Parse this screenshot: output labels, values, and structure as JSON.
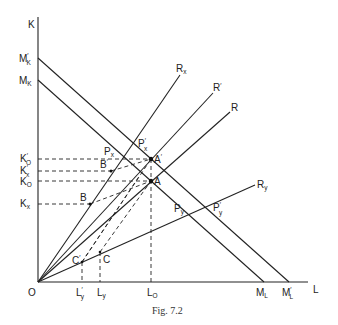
{
  "figure": {
    "caption": "Fig. 7.2",
    "axes": {
      "y_label": "K",
      "x_label": "L",
      "origin_label": "O"
    },
    "y_axis_labels": [
      {
        "id": "Mk_prime",
        "main": "M",
        "sup": "′",
        "sub": "K"
      },
      {
        "id": "Mk",
        "main": "M",
        "sup": "",
        "sub": "K"
      },
      {
        "id": "K0_prime",
        "main": "K",
        "sup": "′",
        "sub": "O"
      },
      {
        "id": "Kx_prime",
        "main": "K",
        "sup": "′",
        "sub": "x"
      },
      {
        "id": "K0",
        "main": "K",
        "sup": "",
        "sub": "O"
      },
      {
        "id": "Kx",
        "main": "K",
        "sup": "",
        "sub": "x"
      }
    ],
    "x_axis_labels": [
      {
        "id": "Ly_prime",
        "main": "L",
        "sup": "′",
        "sub": "y"
      },
      {
        "id": "Ly",
        "main": "L",
        "sup": "",
        "sub": "y"
      },
      {
        "id": "L0",
        "main": "L",
        "sup": "",
        "sub": "O"
      },
      {
        "id": "ML",
        "main": "M",
        "sup": "",
        "sub": "L"
      },
      {
        "id": "ML_prime",
        "main": "M",
        "sup": "′",
        "sub": "L"
      }
    ],
    "rays": [
      {
        "id": "Rx",
        "main": "R",
        "sup": "",
        "sub": "x"
      },
      {
        "id": "R_prime",
        "main": "R",
        "sup": "′",
        "sub": ""
      },
      {
        "id": "R",
        "main": "R",
        "sup": "",
        "sub": ""
      },
      {
        "id": "Ry",
        "main": "R",
        "sup": "",
        "sub": "y"
      }
    ],
    "points": [
      {
        "id": "A_prime",
        "main": "A",
        "sup": "′",
        "sub": ""
      },
      {
        "id": "A",
        "main": "A",
        "sup": "",
        "sub": ""
      },
      {
        "id": "B_prime",
        "main": "B",
        "sup": "′",
        "sub": ""
      },
      {
        "id": "B",
        "main": "B",
        "sup": "",
        "sub": ""
      },
      {
        "id": "C_prime",
        "main": "C",
        "sup": "′",
        "sub": ""
      },
      {
        "id": "C",
        "main": "C",
        "sup": "",
        "sub": ""
      },
      {
        "id": "Px_prime",
        "main": "P",
        "sup": "′",
        "sub": "x"
      },
      {
        "id": "Px",
        "main": "P",
        "sup": "",
        "sub": "x"
      },
      {
        "id": "Py",
        "main": "P",
        "sup": "",
        "sub": "y"
      },
      {
        "id": "Py_prime",
        "main": "P",
        "sup": "′",
        "sub": "y"
      }
    ]
  }
}
